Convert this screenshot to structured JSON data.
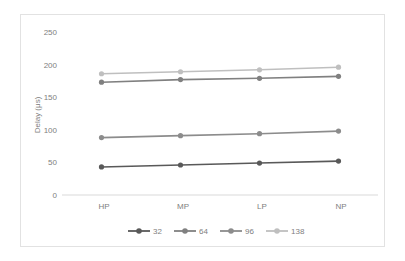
{
  "chart_data": {
    "type": "line",
    "title": "",
    "subtitle": "",
    "xlabel": "",
    "ylabel": "Delay (μs)",
    "categories": [
      "HP",
      "MP",
      "LP",
      "NP"
    ],
    "ylim": [
      0,
      250
    ],
    "ytick_labels": [
      "0",
      "50",
      "100",
      "150",
      "200",
      "250"
    ],
    "yticks": [
      0,
      50,
      100,
      150,
      200,
      250
    ],
    "grid": false,
    "legend_position": "bottom",
    "series": [
      {
        "name": "32",
        "values": [
          43,
          46,
          49,
          52
        ],
        "color": "#595959",
        "marker": "circle"
      },
      {
        "name": "64",
        "values": [
          173,
          177,
          179,
          182
        ],
        "color": "#808080",
        "marker": "circle"
      },
      {
        "name": "96",
        "values": [
          88,
          91,
          94,
          98
        ],
        "color": "#8c8c8c",
        "marker": "circle"
      },
      {
        "name": "138",
        "values": [
          186,
          189,
          192,
          196
        ],
        "color": "#bfbfbf",
        "marker": "circle"
      }
    ]
  },
  "axis": {
    "y_title": "Delay (μs)",
    "y_tick_0": "0",
    "y_tick_50": "50",
    "y_tick_100": "100",
    "y_tick_150": "150",
    "y_tick_200": "200",
    "y_tick_250": "250",
    "x_tick_0": "HP",
    "x_tick_1": "MP",
    "x_tick_2": "LP",
    "x_tick_3": "NP"
  },
  "legend": {
    "items": [
      {
        "label": "32",
        "color": "#595959"
      },
      {
        "label": "64",
        "color": "#808080"
      },
      {
        "label": "96",
        "color": "#8c8c8c"
      },
      {
        "label": "138",
        "color": "#bfbfbf"
      }
    ]
  },
  "colors": {
    "frame_border": "#e2e2e2",
    "axis_line": "#d9d9d9",
    "text": "#808080",
    "background": "#ffffff"
  }
}
